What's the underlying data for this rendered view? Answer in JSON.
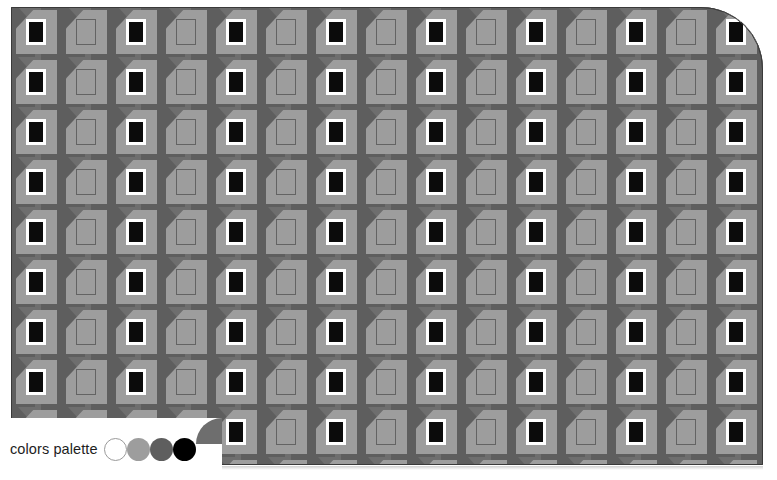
{
  "pattern": {
    "name": "seamless-houses-pattern",
    "type": "geometric-tile",
    "columns": 16,
    "rows": 10,
    "cell_size_px": 50,
    "motif": "house-with-door",
    "colors": {
      "background_dark": "#6e6e6e",
      "shade_dark": "#5e5e5e",
      "house_light": "#9d9d9d",
      "door_solid": "#0b0b0b",
      "door_frame": "#ffffff",
      "door_outline": "#636363",
      "card_border": "#3a3a3a"
    },
    "corner_radius_px": 62
  },
  "palette": {
    "label": "colors palette",
    "swatches": [
      {
        "name": "white",
        "hex": "#ffffff",
        "outlined": true
      },
      {
        "name": "light-gray",
        "hex": "#9d9d9d",
        "outlined": false
      },
      {
        "name": "dark-gray",
        "hex": "#5e5e5e",
        "outlined": false
      },
      {
        "name": "black",
        "hex": "#000000",
        "outlined": false
      }
    ]
  }
}
